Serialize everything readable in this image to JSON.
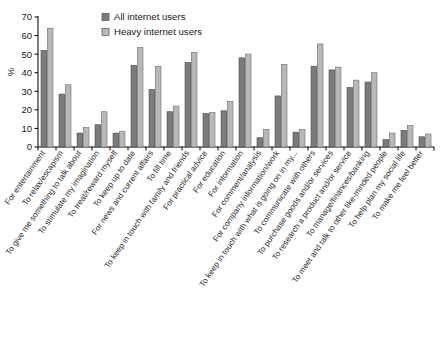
{
  "chart_data": {
    "type": "bar",
    "title": "",
    "subtitle": "",
    "xlabel": "",
    "ylabel": "%",
    "ylim": [
      0,
      70
    ],
    "yticks": [
      0,
      10,
      20,
      30,
      40,
      50,
      60,
      70
    ],
    "grid": false,
    "legend_position": "top-center",
    "categories": [
      "For entertainment",
      "To relax/escapism",
      "To give me something to talk about",
      "To stimulate my imagination",
      "To treat/reward myself",
      "To keep up to date",
      "For news and current affairs",
      "To fill time",
      "To keep in touch with family and friends",
      "For practical advice",
      "For education",
      "For information",
      "For comment/analysis",
      "For company information/work",
      "To keep in touch with what is going on in my...",
      "To communicate with others",
      "To purchase goods and/or services",
      "To research a product and/or service",
      "To manage/finances/banking",
      "To meet and talk to other like-minded people",
      "To help plan my social life",
      "To make me feel better"
    ],
    "series": [
      {
        "name": "All internet users",
        "color": "#7b7b7b",
        "values": [
          52,
          28.5,
          7.5,
          12,
          7.5,
          44,
          31,
          19,
          45.5,
          18,
          19.5,
          48,
          5,
          27.5,
          8,
          43.5,
          41.5,
          32,
          35,
          4,
          9,
          5.5
        ]
      },
      {
        "name": "Heavy internet users",
        "color": "#b8b8b8",
        "values": [
          64,
          33.5,
          10.5,
          19,
          8.5,
          53.5,
          43.5,
          22,
          51,
          18.5,
          24.5,
          50,
          9.5,
          44.5,
          9.5,
          55.5,
          43,
          36,
          40,
          7.5,
          11.5,
          7
        ]
      }
    ]
  }
}
